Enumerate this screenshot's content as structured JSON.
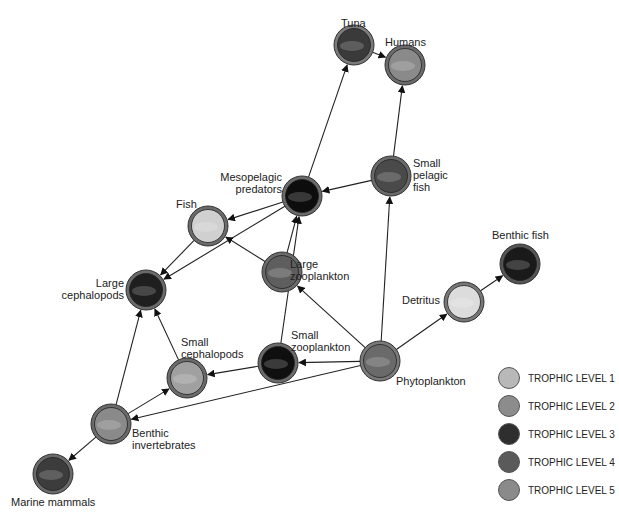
{
  "nodes": [
    {
      "id": "tuna",
      "label": "Tuna",
      "x": 354,
      "y": 45,
      "fill": "#3a3a3a",
      "ring": "#7a7a7a"
    },
    {
      "id": "humans",
      "label": "Humans",
      "x": 405,
      "y": 65,
      "fill": "#8a8a8a",
      "ring": "#6a6a6a"
    },
    {
      "id": "small_pelagic_fish",
      "label": "Small pelagic fish",
      "x": 391,
      "y": 176,
      "fill": "#4a4a4a",
      "ring": "#6a6a6a"
    },
    {
      "id": "mesopelagic_predators",
      "label": "Mesopelagic predators",
      "x": 302,
      "y": 196,
      "fill": "#0d0d0d",
      "ring": "#6a6a6a"
    },
    {
      "id": "fish",
      "label": "Fish",
      "x": 208,
      "y": 226,
      "fill": "#d0d0d0",
      "ring": "#6a6a6a"
    },
    {
      "id": "large_zooplankton",
      "label": "Large zooplankton",
      "x": 282,
      "y": 272,
      "fill": "#5e5e5e",
      "ring": "#6a6a6a"
    },
    {
      "id": "large_cephalopods",
      "label": "Large cephalopods",
      "x": 146,
      "y": 290,
      "fill": "#1f1f1f",
      "ring": "#6a6a6a"
    },
    {
      "id": "benthic_fish",
      "label": "Benthic fish",
      "x": 520,
      "y": 264,
      "fill": "#1a1a1a",
      "ring": "#555555"
    },
    {
      "id": "detritus",
      "label": "Detritus",
      "x": 464,
      "y": 302,
      "fill": "#dcdcdc",
      "ring": "#777777"
    },
    {
      "id": "small_zooplankton",
      "label": "Small zooplankton",
      "x": 278,
      "y": 363,
      "fill": "#0f0f0f",
      "ring": "#6a6a6a"
    },
    {
      "id": "phytoplankton",
      "label": "Phytoplankton",
      "x": 380,
      "y": 361,
      "fill": "#6a6a6a",
      "ring": "#7a7a7a"
    },
    {
      "id": "small_cephalopods",
      "label": "Small cephalopods",
      "x": 187,
      "y": 378,
      "fill": "#a0a0a0",
      "ring": "#6a6a6a"
    },
    {
      "id": "benthic_invertebrates",
      "label": "Benthic invertebrates",
      "x": 111,
      "y": 424,
      "fill": "#8a8a8a",
      "ring": "#6a6a6a"
    },
    {
      "id": "marine_mammals",
      "label": "Marine mammals",
      "x": 53,
      "y": 474,
      "fill": "#3c3c3c",
      "ring": "#6a6a6a"
    }
  ],
  "labels": {
    "tuna": "Tuna",
    "humans": "Humans",
    "small_pelagic_fish_1": "Small",
    "small_pelagic_fish_2": "pelagic",
    "small_pelagic_fish_3": "fish",
    "mesopelagic_1": "Mesopelagic",
    "mesopelagic_2": "predators",
    "fish": "Fish",
    "large_zoo_1": "Large",
    "large_zoo_2": "zooplankton",
    "large_ceph_1": "Large",
    "large_ceph_2": "cephalopods",
    "benthic_fish": "Benthic fish",
    "detritus": "Detritus",
    "small_zoo_1": "Small",
    "small_zoo_2": "zooplankton",
    "phytoplankton": "Phytoplankton",
    "small_ceph_1": "Small",
    "small_ceph_2": "cephalopods",
    "benthic_inv_1": "Benthic",
    "benthic_inv_2": "invertebrates",
    "marine_mammals": "Marine mammals"
  },
  "edges": [
    [
      "tuna",
      "humans"
    ],
    [
      "small_pelagic_fish",
      "humans"
    ],
    [
      "mesopelagic_predators",
      "tuna"
    ],
    [
      "small_pelagic_fish",
      "mesopelagic_predators"
    ],
    [
      "phytoplankton",
      "small_pelagic_fish"
    ],
    [
      "mesopelagic_predators",
      "fish"
    ],
    [
      "mesopelagic_predators",
      "large_cephalopods"
    ],
    [
      "large_zooplankton",
      "fish"
    ],
    [
      "large_zooplankton",
      "mesopelagic_predators"
    ],
    [
      "small_zooplankton",
      "mesopelagic_predators"
    ],
    [
      "fish",
      "large_cephalopods"
    ],
    [
      "phytoplankton",
      "large_zooplankton"
    ],
    [
      "phytoplankton",
      "detritus"
    ],
    [
      "detritus",
      "benthic_fish"
    ],
    [
      "phytoplankton",
      "small_zooplankton"
    ],
    [
      "small_zooplankton",
      "small_cephalopods"
    ],
    [
      "phytoplankton",
      "benthic_invertebrates"
    ],
    [
      "small_cephalopods",
      "large_cephalopods"
    ],
    [
      "benthic_invertebrates",
      "large_cephalopods"
    ],
    [
      "benthic_invertebrates",
      "small_cephalopods"
    ],
    [
      "benthic_invertebrates",
      "marine_mammals"
    ]
  ],
  "legend": [
    {
      "label": "TROPHIC LEVEL 1",
      "color": "#b8b8b8"
    },
    {
      "label": "TROPHIC LEVEL 2",
      "color": "#8c8c8c"
    },
    {
      "label": "TROPHIC LEVEL 3",
      "color": "#2e2e2e"
    },
    {
      "label": "TROPHIC LEVEL 4",
      "color": "#5a5a5a"
    },
    {
      "label": "TROPHIC LEVEL 5",
      "color": "#8a8a8a"
    }
  ]
}
